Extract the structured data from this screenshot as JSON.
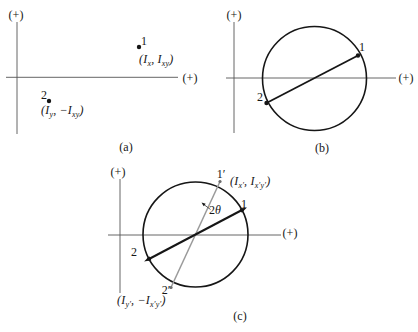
{
  "colors": {
    "background": "#ffffff",
    "ink": "#161616",
    "axis": "#555555",
    "gray_line": "#9a9a9a"
  },
  "panel_a": {
    "caption": "(a)",
    "axis_vertical_label": "(+)",
    "axis_horizontal_label": "(+)",
    "point1": {
      "number": "1",
      "coords": [
        {
          "t": "n",
          "v": "(I"
        },
        {
          "t": "s",
          "v": "x"
        },
        {
          "t": "n",
          "v": ", I"
        },
        {
          "t": "s",
          "v": "xy"
        },
        {
          "t": "n",
          "v": ")"
        }
      ]
    },
    "point2": {
      "number": "2",
      "coords": [
        {
          "t": "n",
          "v": "(I"
        },
        {
          "t": "s",
          "v": "y"
        },
        {
          "t": "n",
          "v": ", −I"
        },
        {
          "t": "s",
          "v": "xy"
        },
        {
          "t": "n",
          "v": ")"
        }
      ]
    }
  },
  "panel_b": {
    "caption": "(b)",
    "axis_vertical_label": "(+)",
    "axis_horizontal_label": "(+)",
    "point1": {
      "number": "1"
    },
    "point2": {
      "number": "2"
    }
  },
  "panel_c": {
    "caption": "(c)",
    "axis_vertical_label": "(+)",
    "axis_horizontal_label": "(+)",
    "point1": {
      "number": "1"
    },
    "point2": {
      "number": "2"
    },
    "point1_prime": {
      "number": "1′",
      "coords": [
        {
          "t": "n",
          "v": "(I"
        },
        {
          "t": "s",
          "v": "x′"
        },
        {
          "t": "n",
          "v": ", I"
        },
        {
          "t": "s",
          "v": "x′y′"
        },
        {
          "t": "n",
          "v": ")"
        }
      ]
    },
    "point2_prime": {
      "number": "2′",
      "coords": [
        {
          "t": "n",
          "v": "(I"
        },
        {
          "t": "s",
          "v": "y′"
        },
        {
          "t": "n",
          "v": ", −I"
        },
        {
          "t": "s",
          "v": "x′y′"
        },
        {
          "t": "n",
          "v": ")"
        }
      ]
    },
    "angle_label": [
      {
        "t": "n",
        "v": "2"
      },
      {
        "t": "i",
        "v": "θ"
      }
    ]
  }
}
